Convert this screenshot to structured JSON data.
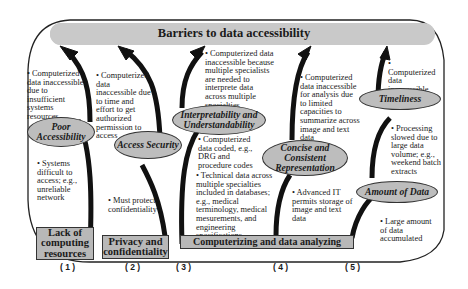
{
  "title": "Barriers to data accessibility",
  "ovals": {
    "poor_accessibility": "Poor Accessibility",
    "access_security": "Access Security",
    "interpretability": "Interpretability and Understandability",
    "concise": "Concise and Consistent Representation",
    "timeliness": "Timeliness",
    "amount_of_data": "Amount of Data"
  },
  "boxes": {
    "lack_of_computing": "Lack of computing resources",
    "privacy": "Privacy and confidentiality",
    "computerizing": "Computerizing and data analyzing"
  },
  "notes": {
    "n1_top": "• Computerized data inaccessible due to insufficient systems resources",
    "n1_bottom": "• Systems difficult to access; e.g., unreliable network",
    "n2_top": "• Computerized data inaccessible due to time and effort to get authorized permission to access",
    "n2_bottom": "• Must protect confidentiality",
    "n3_top": "• Computerized data inaccessible because multiple specialists are needed to interprete data across multiple specialties",
    "n3_mid": "• Computerized data coded, e.g., DRG and procedure codes",
    "n3_bottom": "• Technical data across multiple specialties included in databases; e.g., medical terminology, medical mesurements, and engineering specifications.",
    "n4_top": "• Computerized data inaccessible for analysis due to limited capacities to summarize across image and text data",
    "n4_bottom": "• Advanced IT permits storage of image and text data",
    "n5_top": "• Computerized data inaccessible when needed",
    "n5_mid": "• Processing slowed due to large data volume; e.g., weekend batch extracts",
    "n5_bottom": "• Large amount of data accumulated"
  },
  "column_numbers": [
    "( 1 )",
    "( 2 )",
    "( 3 )",
    "( 4 )",
    "( 5 )"
  ]
}
